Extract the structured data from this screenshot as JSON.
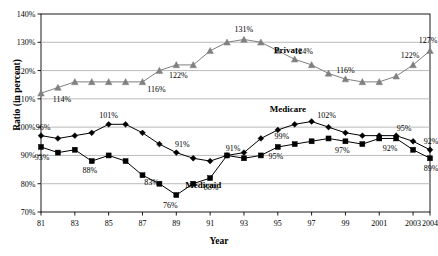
{
  "chart_data": {
    "type": "line",
    "title": "",
    "xlabel": "Year",
    "ylabel": "Ratio (in percent)",
    "ylim": [
      70,
      140
    ],
    "ytick_labels": [
      "70%",
      "80%",
      "90%",
      "100%",
      "110%",
      "120%",
      "130%",
      "140%"
    ],
    "ytick_values": [
      70,
      80,
      90,
      100,
      110,
      120,
      130,
      140
    ],
    "grid": true,
    "legend_position": "inline-annotations",
    "x": [
      1981,
      1982,
      1983,
      1984,
      1985,
      1986,
      1987,
      1988,
      1989,
      1990,
      1991,
      1992,
      1993,
      1994,
      1995,
      1996,
      1997,
      1998,
      1999,
      2000,
      2001,
      2002,
      2003,
      2004
    ],
    "xtick_labels": [
      "81",
      "83",
      "85",
      "87",
      "89",
      "91",
      "93",
      "95",
      "97",
      "99",
      "2001",
      "2003",
      "2004"
    ],
    "xtick_values": [
      1981,
      1983,
      1985,
      1987,
      1989,
      1991,
      1993,
      1995,
      1997,
      1999,
      2001,
      2003,
      2004
    ],
    "series": [
      {
        "name": "Private",
        "marker": "triangle",
        "color": "#808080",
        "values": [
          112,
          114,
          116,
          116,
          116,
          116,
          116,
          120,
          122,
          122,
          127,
          130,
          131,
          130,
          127,
          124,
          122,
          119,
          117,
          116,
          116,
          118,
          122,
          127
        ]
      },
      {
        "name": "Medicare",
        "marker": "diamond",
        "color": "#000000",
        "values": [
          97,
          96,
          97,
          98,
          101,
          101,
          98,
          94,
          91,
          89,
          88,
          90,
          91,
          96,
          99,
          101,
          102,
          100,
          98,
          97,
          97,
          97,
          95,
          92
        ]
      },
      {
        "name": "Medicaid",
        "marker": "square",
        "color": "#000000",
        "values": [
          93,
          91,
          92,
          88,
          90,
          88,
          83,
          80,
          76,
          80,
          82,
          90,
          89,
          90,
          93,
          94,
          95,
          96,
          95,
          94,
          96,
          96,
          92,
          89
        ]
      }
    ],
    "data_labels": [
      {
        "series": "Private",
        "year": 1982,
        "text": "114%"
      },
      {
        "series": "Private",
        "year": 1987,
        "text": "116%"
      },
      {
        "series": "Private",
        "year": 1989,
        "text": "122%"
      },
      {
        "series": "Private",
        "year": 1993,
        "text": "131%"
      },
      {
        "series": "Private",
        "year": 1996,
        "text": "124%"
      },
      {
        "series": "Private",
        "year": 1999,
        "text": "116%"
      },
      {
        "series": "Private",
        "year": 2003,
        "text": "122%"
      },
      {
        "series": "Private",
        "year": 2004,
        "text": "127%"
      },
      {
        "series": "Medicare",
        "year": 1981,
        "text": "96%"
      },
      {
        "series": "Medicare",
        "year": 1985,
        "text": "101%"
      },
      {
        "series": "Medicare",
        "year": 1989,
        "text": "91%"
      },
      {
        "series": "Medicare",
        "year": 1992,
        "text": "91%"
      },
      {
        "series": "Medicare",
        "year": 1995,
        "text": "99%"
      },
      {
        "series": "Medicare",
        "year": 1997,
        "text": "102%"
      },
      {
        "series": "Medicare",
        "year": 2002,
        "text": "95%"
      },
      {
        "series": "Medicare",
        "year": 2004,
        "text": "92%"
      },
      {
        "series": "Medicaid",
        "year": 1981,
        "text": "93%"
      },
      {
        "series": "Medicaid",
        "year": 1984,
        "text": "88%"
      },
      {
        "series": "Medicaid",
        "year": 1987,
        "text": "83%"
      },
      {
        "series": "Medicaid",
        "year": 1989,
        "text": "76%"
      },
      {
        "series": "Medicaid",
        "year": 1991,
        "text": "88%"
      },
      {
        "series": "Medicaid",
        "year": 1995,
        "text": "95%"
      },
      {
        "series": "Medicaid",
        "year": 1999,
        "text": "97%"
      },
      {
        "series": "Medicaid",
        "year": 2002,
        "text": "92%"
      },
      {
        "series": "Medicaid",
        "year": 2004,
        "text": "89%"
      }
    ],
    "series_annotations": [
      {
        "text": "Private",
        "year": 1995.6,
        "value": 126.2
      },
      {
        "text": "Medicare",
        "year": 1995.6,
        "value": 105.5
      },
      {
        "text": "Medicaid",
        "year": 1990.6,
        "value": 78.4
      }
    ]
  },
  "axis": {
    "y_title": "Ratio (in percent)",
    "x_title": "Year"
  }
}
